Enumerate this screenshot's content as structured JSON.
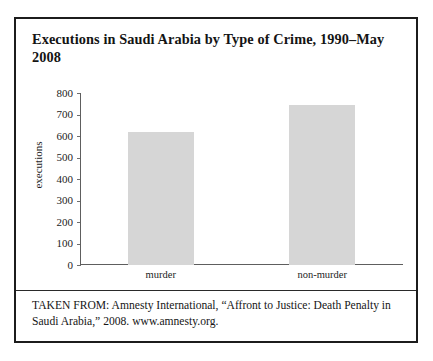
{
  "figure": {
    "title": "Executions in Saudi Arabia by Type of Crime, 1990–May 2008",
    "caption": "TAKEN FROM: Amnesty International, “Affront to Justice: Death Penalty in Saudi Arabia,” 2008. www.amnesty.org.",
    "bar_color": "#d6d6d6",
    "border_color": "#1c1c1c",
    "axis_color": "#5e5e5e"
  },
  "chart_data": {
    "type": "bar",
    "title": "Executions in Saudi Arabia by Type of Crime, 1990–May 2008",
    "categories": [
      "murder",
      "non-murder"
    ],
    "values": [
      620,
      745
    ],
    "series": [
      {
        "name": "executions",
        "values": [
          620,
          745
        ]
      }
    ],
    "xlabel": "",
    "ylabel": "executions",
    "ylim": [
      0,
      800
    ],
    "ytick_step": 100,
    "yticks": [
      800,
      700,
      600,
      500,
      400,
      300,
      200,
      100,
      0
    ],
    "ytick_labels": [
      "800",
      "700",
      "600",
      "500",
      "400",
      "300",
      "200",
      "100",
      "0"
    ],
    "grid": false,
    "legend": false,
    "source": "Amnesty International, “Affront to Justice: Death Penalty in Saudi Arabia,” 2008. www.amnesty.org."
  }
}
